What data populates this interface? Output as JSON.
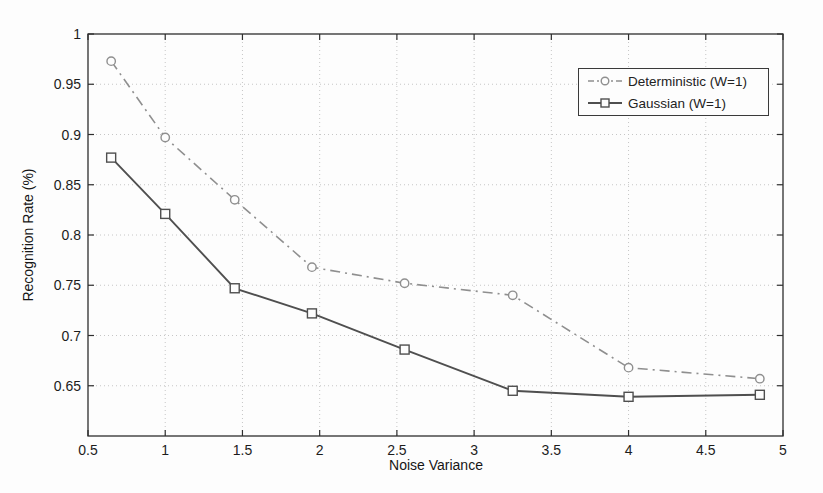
{
  "figure": {
    "background_color": "#fdfdfd",
    "axis_color": "#2e2e2e",
    "grid_color": "#c6c6c6"
  },
  "chart_data": {
    "type": "line",
    "title": "",
    "xlabel": "Noise Variance",
    "ylabel": "Recognition Rate (%)",
    "xlim": [
      0.5,
      5
    ],
    "ylim": [
      0.6,
      1.0
    ],
    "xticks": [
      0.5,
      1,
      1.5,
      2,
      2.5,
      3,
      3.5,
      4,
      4.5,
      5
    ],
    "xtick_labels": [
      "0.5",
      "1",
      "1.5",
      "2",
      "2.5",
      "3",
      "3.5",
      "4",
      "4.5",
      "5"
    ],
    "yticks": [
      0.65,
      0.7,
      0.75,
      0.8,
      0.85,
      0.9,
      0.95,
      1
    ],
    "ytick_labels": [
      "0.65",
      "0.7",
      "0.75",
      "0.8",
      "0.85",
      "0.9",
      "0.95",
      "1"
    ],
    "grid": true,
    "legend_position": "upper right",
    "x": [
      0.65,
      1.0,
      1.45,
      1.95,
      2.55,
      3.25,
      4.0,
      4.85
    ],
    "series": [
      {
        "name": "Deterministic (W=1)",
        "marker": "circle",
        "line_style": "dash-dot",
        "color": "#8f8f8f",
        "values": [
          0.973,
          0.897,
          0.835,
          0.768,
          0.752,
          0.74,
          0.668,
          0.657
        ]
      },
      {
        "name": "Gaussian (W=1)",
        "marker": "square",
        "line_style": "solid",
        "color": "#4f4f4f",
        "values": [
          0.877,
          0.821,
          0.747,
          0.722,
          0.686,
          0.645,
          0.639,
          0.641
        ]
      }
    ]
  }
}
